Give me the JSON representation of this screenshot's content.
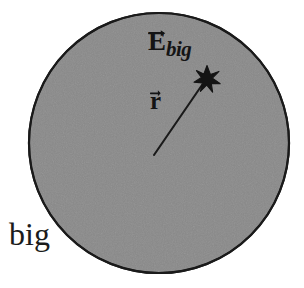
{
  "figure": {
    "type": "physics-diagram",
    "background_color": "#ffffff",
    "sphere": {
      "name": "big-sphere",
      "fill_color": "#8a8a8a",
      "stroke_color": "#1a1a1a",
      "stroke_width": 2,
      "center_x": 159,
      "center_y": 143,
      "radius": 130
    },
    "caption": {
      "name": "sphere-caption",
      "text": "big",
      "x": 9,
      "y": 218,
      "font_size": 32,
      "color": "#1b1b1b"
    },
    "field_label": {
      "name": "electric-field-label",
      "symbol": "E",
      "subscript": "big",
      "has_vector_arrow": true,
      "x": 148,
      "y": 28,
      "color": "#141414"
    },
    "r_label": {
      "name": "radius-vector-label",
      "symbol": "r",
      "has_vector_arrow": true,
      "x": 150,
      "y": 88,
      "color": "#141414"
    },
    "radius_line": {
      "name": "radius-vector-line",
      "from_x": 154,
      "from_y": 155,
      "to_x": 203,
      "to_y": 84,
      "stroke_color": "#1a1a1a",
      "stroke_width": 2
    },
    "field_point": {
      "name": "field-point-star",
      "marker": "star",
      "points": 8,
      "x": 207,
      "y": 79,
      "outer_radius": 13,
      "inner_radius": 5,
      "fill_color": "#141414"
    }
  }
}
